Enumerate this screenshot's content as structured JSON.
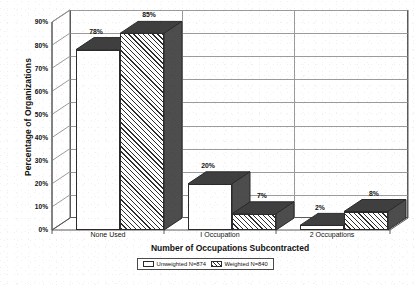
{
  "chart_data": {
    "type": "bar",
    "title": "",
    "xlabel": "Number of Occupations Subcontracted",
    "ylabel": "Percentage of Organizations",
    "categories": [
      "None Used",
      "I Occupation",
      "2 Occupations"
    ],
    "series": [
      {
        "name": "Unweighted N=874",
        "values": [
          78,
          85,
          0
        ]
      },
      {
        "name": "Weighted N=840",
        "values": [
          0,
          0,
          0
        ]
      }
    ],
    "grouped_values": {
      "unweighted": [
        78,
        20,
        2
      ],
      "weighted": [
        85,
        7,
        8
      ]
    },
    "data_labels": [
      "78%",
      "85%",
      "20%",
      "7%",
      "2%",
      "8%"
    ],
    "ylim": [
      0,
      90
    ],
    "ytick_labels": [
      "0%",
      "10%",
      "20%",
      "30%",
      "40%",
      "50%",
      "60%",
      "70%",
      "80%",
      "90%"
    ],
    "ytick_values": [
      0,
      10,
      20,
      30,
      40,
      50,
      60,
      70,
      80,
      90
    ],
    "grid": true,
    "legend_position": "bottom",
    "style": "3d-grouped-bar-grayscale"
  },
  "axis": {
    "y_title": "Percentage of Organizations",
    "x_title": "Number of Occupations Subcontracted"
  },
  "legend": {
    "unweighted_label": "Unweighted N=874",
    "weighted_label": "Weighted N=840"
  },
  "bars": [
    {
      "group": "None Used",
      "series": "unweighted",
      "value": 78,
      "label": "78%"
    },
    {
      "group": "None Used",
      "series": "weighted",
      "value": 85,
      "label": "85%"
    },
    {
      "group": "I Occupation",
      "series": "unweighted",
      "value": 20,
      "label": "20%"
    },
    {
      "group": "I Occupation",
      "series": "weighted",
      "value": 7,
      "label": "7%"
    },
    {
      "group": "2 Occupations",
      "series": "unweighted",
      "value": 2,
      "label": "2%"
    },
    {
      "group": "2 Occupations",
      "series": "weighted",
      "value": 8,
      "label": "8%"
    }
  ],
  "colors": {
    "axis_line": "#5a5a5a",
    "grid_line": "#9b9b9b",
    "bar_outline": "#2b2b2b",
    "bar_plain_fill": "#ffffff",
    "bar_hatch_fill": "#2f2f2f",
    "face_dark": "#3a3a3a",
    "face_mid": "#545454",
    "text": "#111111"
  }
}
